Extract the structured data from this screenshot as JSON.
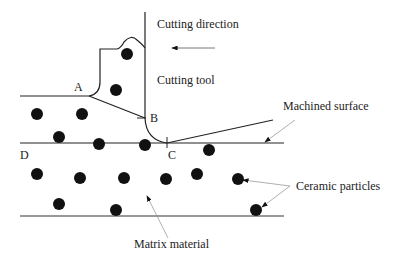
{
  "diagram": {
    "type": "orthogonal-cutting-schematic",
    "labels": {
      "cutting_direction": "Cutting direction",
      "cutting_tool": "Cutting tool",
      "machined_surface": "Machined surface",
      "ceramic_particles": "Ceramic particles",
      "matrix_material": "Matrix material"
    },
    "points": {
      "A": "A",
      "B": "B",
      "C": "C",
      "D": "D"
    },
    "colors": {
      "line": "#222222",
      "particle": "#111111",
      "leader": "#999999"
    },
    "particle_count": 17
  }
}
